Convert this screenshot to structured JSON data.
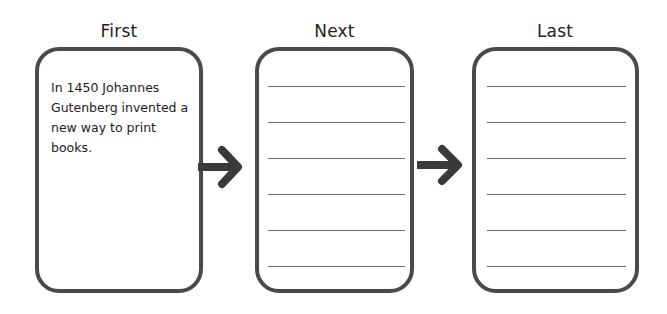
{
  "columns": [
    {
      "title": "First",
      "text": "In 1450 Johannes Gutenberg invented a new way to print books.",
      "lines": 0
    },
    {
      "title": "Next",
      "text": "",
      "lines": 6
    },
    {
      "title": "Last",
      "text": "",
      "lines": 6
    }
  ],
  "arrows": [
    {
      "from": "First",
      "to": "Next"
    },
    {
      "from": "Next",
      "to": "Last"
    }
  ],
  "colors": {
    "border": "#4a4a4a",
    "arrow": "#3a3a3a",
    "rule": "#6a6a6a"
  }
}
